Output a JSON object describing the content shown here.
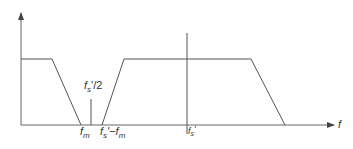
{
  "diagram": {
    "title": "",
    "colors": {
      "line": "#555555",
      "text": "#333333",
      "background": "#ffffff"
    },
    "axes": {
      "x_label": "f",
      "y_label": ""
    },
    "labels": {
      "fm_main": "f",
      "fm_sub": "m",
      "half_fs_main": "f",
      "half_fs_sub": "s",
      "half_fs_suffix": "'/2",
      "fs_minus_fm_main": "f",
      "fs_minus_fm_sub": "s",
      "fs_minus_fm_mid": "'−f",
      "fs_minus_fm_sub2": "m",
      "fs_main": "f",
      "fs_sub": "s",
      "fs_prime": "'"
    },
    "shapes": [
      {
        "name": "baseband-spectrum",
        "description": "Flat then falling edge to f_m"
      },
      {
        "name": "image-spectrum",
        "description": "Rising from f_s'-f_m, flat across f_s', falling edge"
      },
      {
        "name": "nyquist-marker",
        "description": "Short vertical line at f_s'/2"
      },
      {
        "name": "sampling-frequency-line",
        "description": "Vertical line at f_s'"
      }
    ]
  }
}
